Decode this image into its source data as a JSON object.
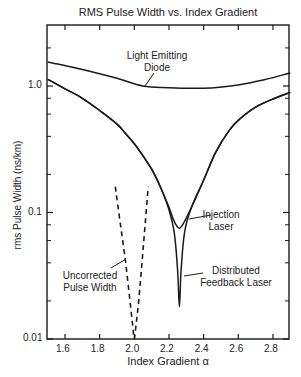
{
  "chart_data": {
    "type": "line",
    "title": "RMS Pulse Width vs. Index Gradient",
    "xlabel": "Index Gradient α",
    "ylabel": "rms Pulse Width (ns/km)",
    "xlim": [
      1.5,
      2.9
    ],
    "ylim": [
      0.01,
      3.0
    ],
    "yscale": "log",
    "grid": false,
    "legend": "none (inline annotations)",
    "x_ticks": [
      "1.6",
      "1.8",
      "2.0",
      "2.2",
      "2.4",
      "2.6",
      "2.8"
    ],
    "y_ticks": [
      "0.01",
      "0.1",
      "1.0"
    ],
    "series": [
      {
        "name": "Light Emitting Diode",
        "style": "solid",
        "x": [
          1.5,
          1.7,
          1.9,
          2.05,
          2.2,
          2.4,
          2.6,
          2.75,
          2.9
        ],
        "values": [
          1.55,
          1.35,
          1.15,
          1.0,
          0.97,
          0.96,
          1.02,
          1.12,
          1.27
        ]
      },
      {
        "name": "Injection Laser",
        "style": "solid",
        "x": [
          1.5,
          1.6,
          1.7,
          1.8,
          1.9,
          1.95,
          2.0,
          2.05,
          2.1,
          2.15,
          2.2,
          2.23,
          2.26,
          2.29,
          2.33,
          2.4,
          2.47,
          2.55,
          2.61,
          2.7,
          2.8,
          2.9
        ],
        "values": [
          1.13,
          0.95,
          0.8,
          0.64,
          0.5,
          0.42,
          0.35,
          0.28,
          0.22,
          0.16,
          0.11,
          0.085,
          0.075,
          0.085,
          0.11,
          0.18,
          0.3,
          0.45,
          0.55,
          0.68,
          0.79,
          0.89
        ]
      },
      {
        "name": "Distributed Feedback Laser",
        "style": "solid",
        "x": [
          1.5,
          1.6,
          1.7,
          1.8,
          1.9,
          1.95,
          2.0,
          2.05,
          2.1,
          2.15,
          2.2,
          2.23,
          2.25,
          2.26,
          2.27,
          2.29,
          2.33,
          2.4,
          2.47,
          2.55,
          2.61,
          2.7,
          2.8,
          2.9
        ],
        "values": [
          1.13,
          0.95,
          0.8,
          0.64,
          0.5,
          0.42,
          0.35,
          0.28,
          0.22,
          0.16,
          0.105,
          0.07,
          0.035,
          0.018,
          0.035,
          0.07,
          0.11,
          0.18,
          0.3,
          0.45,
          0.55,
          0.68,
          0.79,
          0.89
        ]
      },
      {
        "name": "Uncorrected Pulse Width",
        "style": "dashed",
        "x": [
          1.89,
          1.92,
          1.95,
          1.975,
          1.99,
          2.0,
          2.01,
          2.025,
          2.05,
          2.08
        ],
        "values": [
          0.16,
          0.08,
          0.04,
          0.02,
          0.013,
          0.01,
          0.013,
          0.02,
          0.05,
          0.16
        ]
      }
    ],
    "annotations": [
      {
        "text_lines": [
          "Light Emitting",
          "Diode"
        ],
        "target": "Light Emitting Diode"
      },
      {
        "text_lines": [
          "Injection",
          "Laser"
        ],
        "target": "Injection Laser"
      },
      {
        "text_lines": [
          "Distributed",
          "Feedback Laser"
        ],
        "target": "Distributed Feedback Laser"
      },
      {
        "text_lines": [
          "Uncorrected",
          "Pulse Width"
        ],
        "target": "Uncorrected Pulse Width"
      }
    ]
  },
  "labels": {
    "title": "RMS Pulse Width vs. Index Gradient",
    "xlabel": "Index Gradient α",
    "ylabel": "rms Pulse Width (ns/km)",
    "ann_led_1": "Light Emitting",
    "ann_led_2": "Diode",
    "ann_inj_1": "Injection",
    "ann_inj_2": "Laser",
    "ann_dfb_1": "Distributed",
    "ann_dfb_2": "Feedback Laser",
    "ann_unc_1": "Uncorrected",
    "ann_unc_2": "Pulse Width"
  },
  "colors": {
    "line": "#1a1a1a",
    "axis": "#1a1a1a",
    "text": "#222222",
    "background": "#ffffff"
  }
}
